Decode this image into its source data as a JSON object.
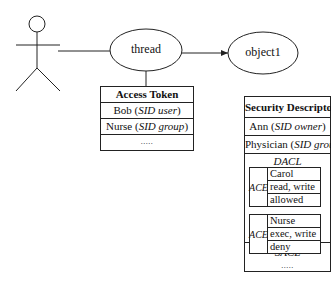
{
  "actor": {
    "label": "user"
  },
  "nodes": {
    "thread": {
      "label": "thread"
    },
    "object": {
      "label": "object1"
    }
  },
  "access_token": {
    "title": "Access Token",
    "rows": [
      {
        "name": "Bob",
        "open": " (",
        "type": "SID user",
        "close": ")"
      },
      {
        "name": "Nurse",
        "open": " (",
        "type": "SID group",
        "close": ")"
      }
    ],
    "more": "....."
  },
  "security_descriptor": {
    "title": "Security Descriptor",
    "owner": {
      "name": "Ann",
      "open": " (",
      "type": "SID owner",
      "close": ")"
    },
    "group": {
      "name": "Physician",
      "open": " (",
      "type": "SID group",
      "close": ")"
    },
    "dacl_label": "DACL",
    "aces": [
      {
        "label": "ACE",
        "who": "Carol",
        "rights": "read, write",
        "action": "allowed"
      },
      {
        "label": "ACE",
        "who": "Nurse",
        "rights": "exec, write",
        "action": "deny"
      }
    ],
    "sacl_label": "SACL",
    "sacl_more": "....."
  }
}
